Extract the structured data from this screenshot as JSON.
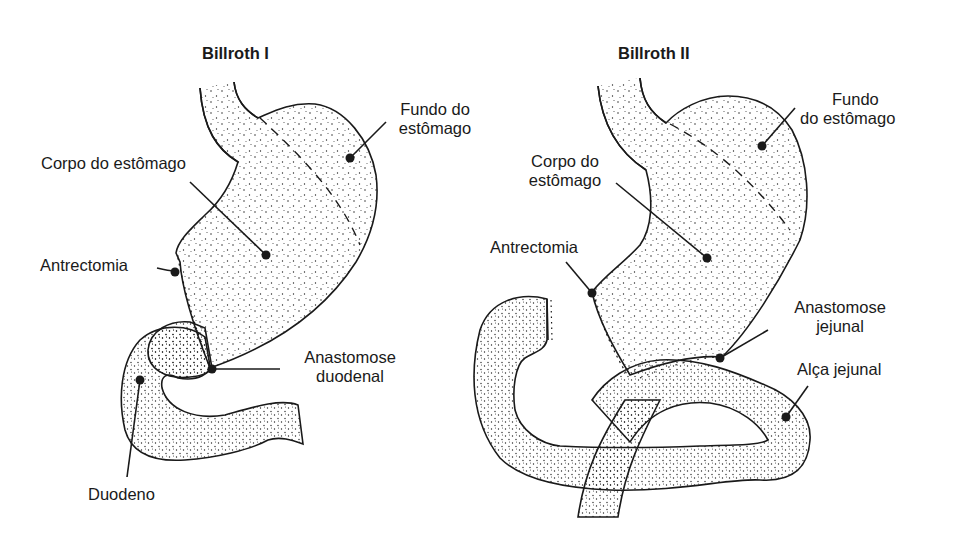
{
  "diagram": {
    "panels": [
      {
        "title": "Billroth I",
        "labels": {
          "fundus": [
            "Fundo do",
            "estômago"
          ],
          "body": "Corpo do estômago",
          "antrectomy": "Antrectomia",
          "anastomosis": [
            "Anastomose",
            "duodenal"
          ],
          "duodenum": "Duodeno"
        }
      },
      {
        "title": "Billroth II",
        "labels": {
          "fundus": [
            "Fundo",
            "do estômago"
          ],
          "body": [
            "Corpo do",
            "estômago"
          ],
          "antrectomy": "Antrectomia",
          "anastomosis": [
            "Anastomose",
            "jejunal"
          ],
          "jejunal_loop": "Alça jejunal"
        }
      }
    ],
    "colors": {
      "ink": "#1a1a1a",
      "background": "#ffffff"
    }
  }
}
